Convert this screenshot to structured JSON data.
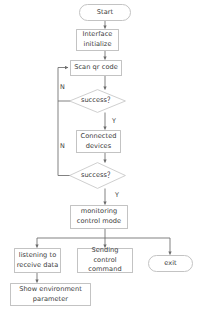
{
  "diagram": {
    "background_color": "#ffffff",
    "stroke_color": "#c3c3c3",
    "connector_color": "#6b6b6b",
    "text_color": "#3a3a3a",
    "nodes": {
      "start": {
        "label": "Start",
        "shape": "terminator"
      },
      "interface_initialize": {
        "label": "Interface initialize",
        "shape": "process"
      },
      "scan_qr_code": {
        "label": "Scan qr code",
        "shape": "process"
      },
      "success_1": {
        "label": "success？",
        "shape": "decision"
      },
      "connected_devices": {
        "label": "Connected devices",
        "shape": "process"
      },
      "success_2": {
        "label": "success？",
        "shape": "decision"
      },
      "monitoring_control_mode": {
        "label": "monitoring control mode",
        "shape": "process"
      },
      "listening_receive_data": {
        "label": "listening to receive data",
        "shape": "process"
      },
      "sending_control_command": {
        "label": "Sending control command",
        "shape": "process"
      },
      "exit": {
        "label": "exit",
        "shape": "terminator"
      },
      "show_environment_parameter": {
        "label": "Show environment parameter",
        "shape": "process"
      }
    },
    "edge_labels": {
      "no_1": "N",
      "yes_1": "Y",
      "no_2": "N",
      "yes_2": "Y"
    },
    "caption": {
      "text": ""
    }
  }
}
